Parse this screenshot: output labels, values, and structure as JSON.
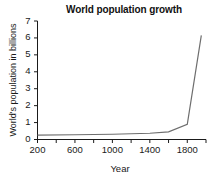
{
  "chart_data": {
    "type": "line",
    "title": "World population growth",
    "xlabel": "Year",
    "ylabel": "World's population in billions",
    "xlim": [
      200,
      2000
    ],
    "ylim": [
      0,
      7
    ],
    "grid": false,
    "legend": null,
    "line_color": "#6e6e6e",
    "axis_color": "#1a1a1a",
    "xticks": [
      200,
      400,
      600,
      800,
      1000,
      1200,
      1400,
      1600,
      1800,
      2000
    ],
    "xtick_labels_shown": [
      "200",
      "600",
      "1000",
      "1400",
      "1800"
    ],
    "xtick_labels_shown_values": [
      200,
      600,
      1000,
      1400,
      1800
    ],
    "yticks": [
      0,
      1,
      2,
      3,
      4,
      5,
      6,
      7
    ],
    "ytick_labels": [
      "0",
      "1",
      "2",
      "3",
      "4",
      "5",
      "6",
      "7"
    ],
    "x": [
      200,
      600,
      1000,
      1400,
      1600,
      1800,
      1950
    ],
    "values": [
      0.26,
      0.28,
      0.31,
      0.37,
      0.45,
      0.9,
      6.15
    ],
    "series": [
      {
        "name": "World population",
        "x": [
          200,
          600,
          1000,
          1400,
          1600,
          1800,
          1950
        ],
        "values": [
          0.26,
          0.28,
          0.31,
          0.37,
          0.45,
          0.9,
          6.15
        ]
      }
    ]
  }
}
